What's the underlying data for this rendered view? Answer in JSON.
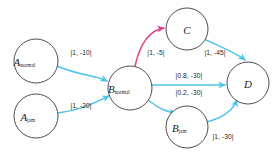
{
  "diagram": {
    "type": "directed-graph",
    "title": "",
    "colors": {
      "edge_default": "#4cc3e8",
      "edge_highlight": "#e0418a",
      "node_stroke": "#3a3a3a",
      "node_fill": "#ffffff",
      "background": "#ffffff",
      "text": "#1d1d1d"
    },
    "nodes": [
      {
        "id": "A_normal",
        "base": "A",
        "sub": "normal",
        "cx": 36,
        "cy": 61,
        "r": 22
      },
      {
        "id": "A_jam",
        "base": "A",
        "sub": "jam",
        "cx": 36,
        "cy": 116,
        "r": 22
      },
      {
        "id": "B_normal",
        "base": "B",
        "sub": "normal",
        "cx": 130,
        "cy": 88,
        "r": 22
      },
      {
        "id": "B_jam",
        "base": "B",
        "sub": "jam",
        "cx": 187,
        "cy": 127,
        "r": 21
      },
      {
        "id": "C",
        "base": "C",
        "sub": "",
        "cx": 187,
        "cy": 29,
        "r": 21
      },
      {
        "id": "D",
        "base": "D",
        "sub": "",
        "cx": 248,
        "cy": 83,
        "r": 21
      }
    ],
    "edges": [
      {
        "id": "e-anormal-bnormal",
        "from": "A_normal",
        "to": "B_normal",
        "label": "|1, -10|",
        "label_x": 81,
        "label_y": 52,
        "color": "edge_default",
        "path": "M 57,66 C 80,76 92,74 107,81"
      },
      {
        "id": "e-ajam-bnormal",
        "from": "A_jam",
        "to": "B_normal",
        "label": "|1, -20|",
        "label_x": 81,
        "label_y": 105,
        "color": "edge_default",
        "path": "M 58,113 C 82,110 94,103 109,96"
      },
      {
        "id": "e-bnormal-c",
        "from": "B_normal",
        "to": "C",
        "label": "|1, -5|",
        "label_x": 156,
        "label_y": 52,
        "color": "edge_highlight",
        "path": "M 135,66 C 140,44 150,30 164,28"
      },
      {
        "id": "e-c-d",
        "from": "C",
        "to": "D",
        "label": "|1, -45|",
        "label_x": 215,
        "label_y": 52,
        "color": "edge_default",
        "path": "M 206,40 C 224,48 238,54 245,60"
      },
      {
        "id": "e-bnormal-d-main",
        "from": "B_normal",
        "to": "D",
        "label": "|0.8, -30|",
        "label_x": 189,
        "label_y": 75,
        "color": "edge_default",
        "path": "M 152,85 L 225,85"
      },
      {
        "id": "e-bnormal-bjam",
        "from": "B_normal",
        "to": "B_jam",
        "label": "|0.2, -30|",
        "label_x": 189,
        "label_y": 92,
        "color": "edge_default",
        "path": "M 147,99 C 160,110 168,112 176,113"
      },
      {
        "id": "e-bjam-d",
        "from": "B_jam",
        "to": "D",
        "label": "|1, -30|",
        "label_x": 223,
        "label_y": 136,
        "color": "edge_default",
        "path": "M 207,122 C 222,118 233,110 237,100"
      }
    ]
  }
}
